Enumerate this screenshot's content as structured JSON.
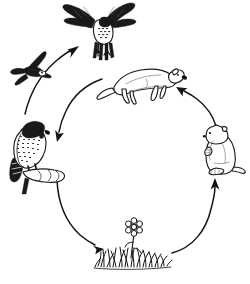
{
  "diagram": {
    "title": "Grassland food chain cycle",
    "type": "cycle-diagram",
    "background_color": "#ffffff",
    "ink_color": "#111111",
    "width": 250,
    "height": 284,
    "style": "black-and-white pen-and-ink line art, no text labels",
    "nodes": [
      {
        "id": "hawk-flying",
        "label": "",
        "icon": "hawk-in-flight-icon",
        "description": "Hawk or falcon in flight, wings spread, seen from the front, talons extended downward",
        "position": "top",
        "x": 95,
        "y": 28,
        "on_cycle_ring": false
      },
      {
        "id": "swallow",
        "label": "",
        "icon": "swallow-in-flight-icon",
        "description": "Dark silhouetted swallow or swift gliding, seen from above",
        "position": "upper-left",
        "x": 28,
        "y": 73,
        "on_cycle_ring": false
      },
      {
        "id": "falcon-perched",
        "label": "",
        "icon": "perched-falcon-icon",
        "description": "Perched falcon with dark hooded head and streaked breast, sitting on a gloved hand or branch",
        "position": "left",
        "x": 38,
        "y": 145,
        "on_cycle_ring": true
      },
      {
        "id": "weasel",
        "label": "",
        "icon": "weasel-icon",
        "description": "Weasel, stoat or ferret in profile facing right, long body and long tail",
        "position": "top-of-ring",
        "x": 140,
        "y": 85,
        "on_cycle_ring": true
      },
      {
        "id": "prairie-dog",
        "label": "",
        "icon": "prairie-dog-icon",
        "description": "Prairie dog or ground squirrel sitting upright on hind legs",
        "position": "right-of-ring",
        "x": 220,
        "y": 148,
        "on_cycle_ring": true
      },
      {
        "id": "grass-and-flower",
        "label": "",
        "icon": "grass-tuft-with-flower-icon",
        "description": "Tuft of grass with a single daisy-like flower on a stem",
        "position": "bottom-of-ring",
        "x": 135,
        "y": 243,
        "on_cycle_ring": true
      }
    ],
    "arrows": [
      {
        "id": "arrow-grass-to-prairie-dog",
        "from": "grass-and-flower",
        "to": "prairie-dog",
        "shape": "arc",
        "direction": "up-right",
        "arrowhead_at": "prairie-dog"
      },
      {
        "id": "arrow-prairie-dog-to-weasel",
        "from": "prairie-dog",
        "to": "weasel",
        "shape": "arc",
        "direction": "up-left",
        "arrowhead_at": "weasel"
      },
      {
        "id": "arrow-weasel-to-falcon",
        "from": "weasel",
        "to": "falcon-perched",
        "shape": "arc",
        "direction": "down-left",
        "arrowhead_at": "falcon-perched"
      },
      {
        "id": "arrow-falcon-to-grass",
        "from": "falcon-perched",
        "to": "grass-and-flower",
        "shape": "arc",
        "direction": "down-right",
        "arrowhead_at": "grass-and-flower"
      },
      {
        "id": "arrow-falcon-to-hawk",
        "from": "falcon-perched",
        "to": "hawk-flying",
        "shape": "arc",
        "direction": "up-right",
        "arrowhead_at": "hawk-flying"
      }
    ]
  }
}
